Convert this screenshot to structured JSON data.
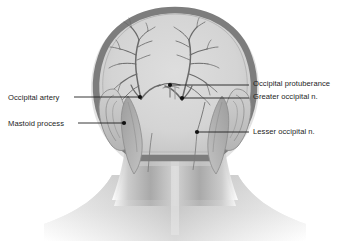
{
  "figure": {
    "view": "posterior",
    "background_color": "#ffffff"
  },
  "colors": {
    "skull_rim": "#7d7d7d",
    "skull_interior": "#d6d6d6",
    "skin_mid": "#b9b9b9",
    "skin_light": "#dcdcdc",
    "muscle": "#a8a8a8",
    "vessel_line": "#5a5a5a",
    "leader_line": "#1f1f1f",
    "label_text": "#1c1c1c",
    "marker_dot": "#111111"
  },
  "labels": [
    {
      "id": "occipital-artery",
      "text": "Occipital artery",
      "side": "left",
      "text_x": 8,
      "text_y": 94,
      "leader": {
        "x1": 74,
        "y1": 97,
        "x2": 140,
        "y2": 97
      },
      "dot": {
        "cx": 140,
        "cy": 97,
        "r": 2.1
      }
    },
    {
      "id": "mastoid-process",
      "text": "Mastoid process",
      "side": "left",
      "text_x": 8,
      "text_y": 120,
      "leader": {
        "x1": 78,
        "y1": 123,
        "x2": 124,
        "y2": 123
      },
      "dot": {
        "cx": 124,
        "cy": 123,
        "r": 2.1
      }
    },
    {
      "id": "occipital-protuberance",
      "text": "Occipital protuberance",
      "side": "right",
      "text_x": 253,
      "text_y": 80,
      "leader": {
        "x1": 249,
        "y1": 85,
        "x2": 170,
        "y2": 85
      },
      "dot": {
        "cx": 170,
        "cy": 85,
        "r": 2.1
      }
    },
    {
      "id": "greater-occipital-nerve",
      "text": "Greater occipital n.",
      "side": "right",
      "text_x": 253,
      "text_y": 93,
      "leader": {
        "x1": 249,
        "y1": 98,
        "x2": 182,
        "y2": 98
      },
      "dot": {
        "cx": 182,
        "cy": 98,
        "r": 2.1
      }
    },
    {
      "id": "lesser-occipital-nerve",
      "text": "Lesser occipital n.",
      "side": "right",
      "text_x": 253,
      "text_y": 128,
      "leader": {
        "x1": 249,
        "y1": 132,
        "x2": 197,
        "y2": 132
      },
      "dot": {
        "cx": 197,
        "cy": 132,
        "r": 2.1
      }
    }
  ],
  "structures": [
    {
      "name": "cranial-vault",
      "description": "rounded skull outline with thick gray rim"
    },
    {
      "name": "occipital-artery-branches",
      "description": "bilateral branching arterial tree over occiput"
    },
    {
      "name": "auricle-left",
      "description": "left ear pinna"
    },
    {
      "name": "auricle-right",
      "description": "right ear pinna"
    },
    {
      "name": "sternocleidomastoid",
      "description": "paired neck muscle bellies"
    },
    {
      "name": "neck-and-shoulders",
      "description": "neck column fading into shoulder contour"
    }
  ]
}
